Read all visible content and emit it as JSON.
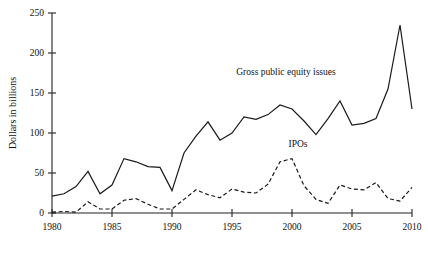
{
  "chart_data": {
    "type": "line",
    "title": "",
    "xlabel": "",
    "ylabel": "Dollars in billions",
    "xlim": [
      1980,
      2010
    ],
    "ylim": [
      0,
      250
    ],
    "xticks": [
      1980,
      1985,
      1990,
      1995,
      2000,
      2005,
      2010
    ],
    "yticks": [
      0,
      50,
      100,
      150,
      200,
      250
    ],
    "grid": false,
    "legend_position": "inline-annotations",
    "x": [
      1980,
      1981,
      1982,
      1983,
      1984,
      1985,
      1986,
      1987,
      1988,
      1989,
      1990,
      1991,
      1992,
      1993,
      1994,
      1995,
      1996,
      1997,
      1998,
      1999,
      2000,
      2001,
      2002,
      2003,
      2004,
      2005,
      2006,
      2007,
      2008,
      2009,
      2010
    ],
    "series": [
      {
        "name": "Gross public equity issues",
        "style": "solid",
        "values": [
          21,
          24,
          33,
          52,
          24,
          35,
          68,
          64,
          58,
          57,
          28,
          75,
          96,
          114,
          91,
          100,
          120,
          117,
          123,
          135,
          130,
          115,
          98,
          118,
          140,
          110,
          112,
          118,
          155,
          235,
          130
        ]
      },
      {
        "name": "IPOs",
        "style": "dashed",
        "values": [
          1,
          2,
          1,
          14,
          5,
          5,
          16,
          18,
          11,
          5,
          5,
          17,
          29,
          23,
          19,
          30,
          26,
          25,
          36,
          64,
          68,
          34,
          17,
          12,
          35,
          30,
          29,
          38,
          18,
          15,
          32
        ]
      }
    ],
    "annotations": [
      {
        "text": "Gross public equity issues",
        "x": 1999.5,
        "y": 172
      },
      {
        "text": "IPOs",
        "x": 2000.5,
        "y": 82
      }
    ]
  }
}
